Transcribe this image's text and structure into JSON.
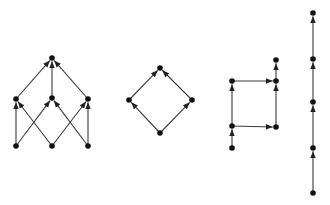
{
  "diagram": {
    "colors": {
      "edge": "#3a3a3a",
      "node": "#111111",
      "background": "#ffffff"
    },
    "graphs": [
      {
        "id": "graph-1",
        "name": "three-level-lattice",
        "nodes": [
          {
            "id": "a",
            "x": 52,
            "y": 58
          },
          {
            "id": "b1",
            "x": 16,
            "y": 99
          },
          {
            "id": "b2",
            "x": 52,
            "y": 98
          },
          {
            "id": "b3",
            "x": 88,
            "y": 99
          },
          {
            "id": "c1",
            "x": 16,
            "y": 146
          },
          {
            "id": "c2",
            "x": 52,
            "y": 146
          },
          {
            "id": "c3",
            "x": 88,
            "y": 146
          }
        ],
        "edges": [
          {
            "from": "b1",
            "to": "a"
          },
          {
            "from": "b2",
            "to": "a"
          },
          {
            "from": "b3",
            "to": "a"
          },
          {
            "from": "c1",
            "to": "b1"
          },
          {
            "from": "c1",
            "to": "b2"
          },
          {
            "from": "c2",
            "to": "b1"
          },
          {
            "from": "c2",
            "to": "b3"
          },
          {
            "from": "c3",
            "to": "b2"
          },
          {
            "from": "c3",
            "to": "b3"
          }
        ]
      },
      {
        "id": "graph-2",
        "name": "diamond",
        "nodes": [
          {
            "id": "top",
            "x": 160,
            "y": 68
          },
          {
            "id": "left",
            "x": 129,
            "y": 100
          },
          {
            "id": "right",
            "x": 192,
            "y": 100
          },
          {
            "id": "bottom",
            "x": 160,
            "y": 133
          }
        ],
        "edges": [
          {
            "from": "left",
            "to": "top"
          },
          {
            "from": "right",
            "to": "top"
          },
          {
            "from": "bottom",
            "to": "left"
          },
          {
            "from": "bottom",
            "to": "right"
          }
        ]
      },
      {
        "id": "graph-3",
        "name": "square-with-tails",
        "nodes": [
          {
            "id": "p0",
            "x": 232,
            "y": 148
          },
          {
            "id": "p1",
            "x": 232,
            "y": 126
          },
          {
            "id": "p2",
            "x": 232,
            "y": 81
          },
          {
            "id": "q1",
            "x": 276,
            "y": 127
          },
          {
            "id": "q2",
            "x": 276,
            "y": 81
          },
          {
            "id": "q3",
            "x": 276,
            "y": 60
          }
        ],
        "edges": [
          {
            "from": "p0",
            "to": "p1"
          },
          {
            "from": "p1",
            "to": "p2"
          },
          {
            "from": "p1",
            "to": "q1"
          },
          {
            "from": "p2",
            "to": "q2"
          },
          {
            "from": "q1",
            "to": "q2"
          },
          {
            "from": "q2",
            "to": "q3"
          }
        ]
      },
      {
        "id": "graph-4",
        "name": "chain",
        "nodes": [
          {
            "id": "n0",
            "x": 313,
            "y": 193
          },
          {
            "id": "n1",
            "x": 313,
            "y": 148
          },
          {
            "id": "n2",
            "x": 313,
            "y": 102
          },
          {
            "id": "n3",
            "x": 313,
            "y": 59
          },
          {
            "id": "n4",
            "x": 313,
            "y": 13
          }
        ],
        "edges": [
          {
            "from": "n0",
            "to": "n1"
          },
          {
            "from": "n1",
            "to": "n2"
          },
          {
            "from": "n2",
            "to": "n3"
          },
          {
            "from": "n3",
            "to": "n4"
          }
        ]
      }
    ]
  }
}
